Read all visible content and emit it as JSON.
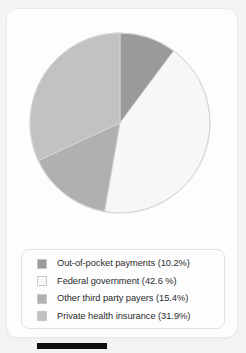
{
  "chart_data": {
    "type": "pie",
    "title": "",
    "subtitle": "",
    "xlabel": "",
    "ylabel": "",
    "legend_position": "bottom",
    "grid": false,
    "start_angle_deg": 0,
    "direction": "clockwise",
    "categories": [
      "Out-of-pocket payments",
      "Federal government",
      "Other third party payers",
      "Private health insurance"
    ],
    "values": [
      10.2,
      42.6,
      15.4,
      31.9
    ],
    "unit": "%",
    "slices": [
      {
        "label": "Out-of-pocket payments",
        "value": 10.2,
        "legend_text": "Out-of-pocket payments (10.2%)",
        "color": "#9a9a9a",
        "order": 1
      },
      {
        "label": "Federal government",
        "value": 42.6,
        "legend_text": "Federal government (42.6 %)",
        "color": "#f7f7f7",
        "order": 2
      },
      {
        "label": "Other third party payers",
        "value": 15.4,
        "legend_text": "Other third party payers (15.4%)",
        "color": "#b0b0b0",
        "order": 3
      },
      {
        "label": "Private health insurance",
        "value": 31.9,
        "legend_text": "Private health insurance (31.9%)",
        "color": "#c2c2c2",
        "order": 4
      }
    ]
  },
  "legend": {
    "items": [
      {
        "text": "Out-of-pocket payments (10.2%)",
        "color": "#9a9a9a"
      },
      {
        "text": "Federal government (42.6 %)",
        "color": "#f7f7f7"
      },
      {
        "text": "Other third party payers (15.4%)",
        "color": "#b0b0b0"
      },
      {
        "text": "Private health insurance (31.9%)",
        "color": "#c2c2c2"
      }
    ]
  },
  "colors": {
    "background": "#f4f4f4",
    "card": "#fdfdfd",
    "card_border": "#e9e9e9",
    "pie_outline": "#d5d5d5",
    "legend_border": "#e2e2e2",
    "text": "#2b2b2b",
    "bottom_bar": "#111111"
  }
}
